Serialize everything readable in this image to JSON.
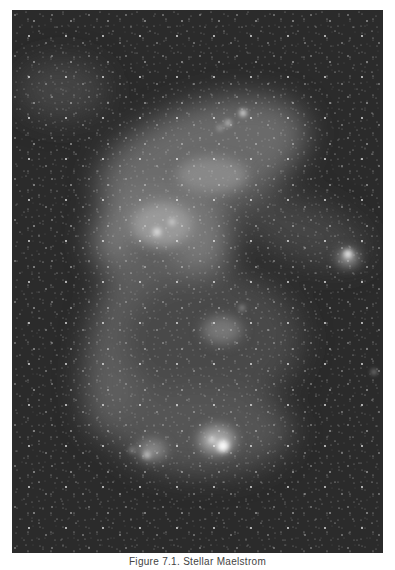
{
  "figure": {
    "caption": "Figure 7.1. Stellar Maelstrom",
    "image_description": "Grayscale astronomical photograph of a dense star field with a diffuse luminous galactic band (bar) sweeping diagonally, bright nebular knots near upper-center, right-middle, and lower-center.",
    "colors": {
      "background": "#2a2a2a",
      "nebula": "#bdbdbd",
      "page": "#ffffff"
    },
    "bright_regions": [
      {
        "name": "upper-knots",
        "x": 230,
        "y": 115
      },
      {
        "name": "central-cloud",
        "x": 160,
        "y": 220
      },
      {
        "name": "right-cluster",
        "x": 348,
        "y": 255
      },
      {
        "name": "lower-nebula",
        "x": 212,
        "y": 437
      }
    ]
  }
}
